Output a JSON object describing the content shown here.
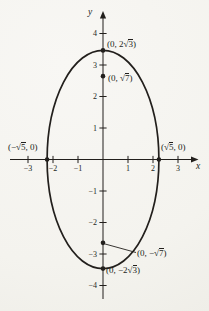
{
  "figure": {
    "background": "#f6f5f1",
    "ink": "#221f1c",
    "axis_labels": {
      "x": "x",
      "y": "y"
    },
    "x_tick_labels": [
      "−3",
      "−2",
      "−1",
      "1",
      "2",
      "3"
    ],
    "y_tick_labels": [
      "4",
      "3",
      "2",
      "1",
      "−1",
      "−2",
      "−3",
      "−4"
    ],
    "point_labels": {
      "top_vertex": {
        "pre": "(0, 2√",
        "rad": "3",
        "post": ")"
      },
      "upper_focus": {
        "pre": "(0, √",
        "rad": "7",
        "post": ")"
      },
      "left_intercept": {
        "pre": "(−√",
        "rad": "5",
        "post": ", 0)"
      },
      "right_intercept": {
        "pre": "(√",
        "rad": "5",
        "post": ", 0)"
      },
      "lower_focus": {
        "pre": "(0, −√",
        "rad": "7",
        "post": ")"
      },
      "bottom_vertex": {
        "pre": "(0, −2√",
        "rad": "3",
        "post": ")"
      }
    }
  },
  "chart_data": {
    "type": "line",
    "curve": "ellipse",
    "title": "",
    "xlabel": "x",
    "ylabel": "y",
    "grid": false,
    "legend": false,
    "xlim": [
      -3.7,
      3.8
    ],
    "ylim": [
      -4.7,
      4.7
    ],
    "x_ticks": [
      -3,
      -2,
      -1,
      1,
      2,
      3
    ],
    "y_ticks": [
      4,
      3,
      2,
      1,
      -1,
      -2,
      -3,
      -4
    ],
    "semi_axes": {
      "x": 2.2360679,
      "y": 3.4641016
    },
    "center": [
      0,
      0
    ],
    "x_intercepts": [
      [
        -2.2360679,
        0
      ],
      [
        2.2360679,
        0
      ]
    ],
    "y_intercepts": [
      [
        0,
        3.4641016
      ],
      [
        0,
        -3.4641016
      ]
    ],
    "foci": [
      [
        0,
        2.6457513
      ],
      [
        0,
        -2.6457513
      ]
    ],
    "marked_points": [
      [
        0,
        3.4641016
      ],
      [
        0,
        2.6457513
      ],
      [
        -2.2360679,
        0
      ],
      [
        2.2360679,
        0
      ],
      [
        0,
        -2.6457513
      ],
      [
        0,
        -3.4641016
      ]
    ]
  }
}
